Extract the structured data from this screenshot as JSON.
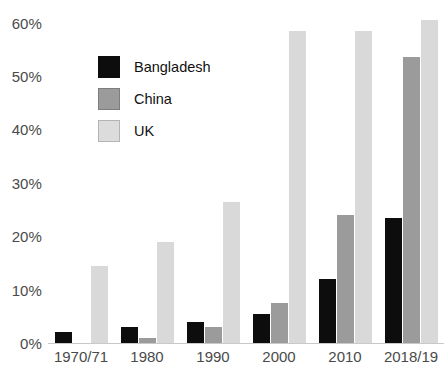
{
  "chart_data": {
    "type": "bar",
    "title": "",
    "subtitle": "",
    "xlabel": "",
    "ylabel": "",
    "categories": [
      "1970/71",
      "1980",
      "1990",
      "2000",
      "2010",
      "2018/19"
    ],
    "series": [
      {
        "name": "Bangladesh",
        "color": "#0d0d0d",
        "values": [
          2.0,
          3.0,
          4.0,
          5.5,
          12.0,
          23.5
        ]
      },
      {
        "name": "China",
        "color": "#9b9b9b",
        "values": [
          0.0,
          1.0,
          3.0,
          7.5,
          24.0,
          53.5
        ]
      },
      {
        "name": "UK",
        "color": "#d9d9d9",
        "values": [
          14.5,
          19.0,
          26.5,
          58.5,
          58.5,
          60.5
        ]
      }
    ],
    "ylim": [
      0,
      62
    ],
    "y_ticks": [
      0,
      10,
      20,
      30,
      40,
      50,
      60
    ],
    "y_tick_labels": [
      "0%",
      "10%",
      "20%",
      "30%",
      "40%",
      "50%",
      "60%"
    ],
    "grid": false,
    "legend_position": "upper-left-inside",
    "value_suffix": "%"
  },
  "legend": {
    "entries": [
      {
        "label": "Bangladesh",
        "swatch": "black-square"
      },
      {
        "label": "China",
        "swatch": "gray-square"
      },
      {
        "label": "UK",
        "swatch": "light-gray-square"
      }
    ]
  }
}
